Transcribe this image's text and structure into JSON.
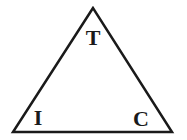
{
  "diagram": {
    "shape": "triangle",
    "stroke_color": "#1a1a1a",
    "background": "#ffffff",
    "vertices": {
      "top": {
        "label": "T",
        "x": 93,
        "y": 8
      },
      "bottom_left": {
        "label": "I",
        "x": 13,
        "y": 132
      },
      "bottom_right": {
        "label": "C",
        "x": 172,
        "y": 132
      }
    },
    "labels": {
      "top": "T",
      "left": "I",
      "right": "C"
    }
  }
}
